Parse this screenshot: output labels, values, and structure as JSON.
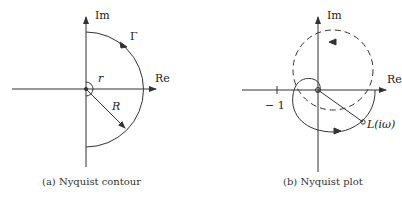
{
  "panel_a": {
    "caption": "(a) Nyquist contour",
    "axis_im": "Im",
    "axis_re": "Re",
    "label_gamma": "Γ",
    "label_r": "r",
    "label_R": "R"
  },
  "panel_b": {
    "caption": "(b) Nyquist plot",
    "axis_im": "Im",
    "axis_re": "Re",
    "label_minus_one": "− 1",
    "label_L": "L(iω)"
  },
  "colors": {
    "line": "#333333",
    "background": "#ffffff"
  }
}
